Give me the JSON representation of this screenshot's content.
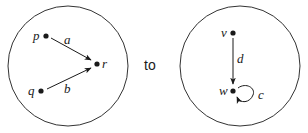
{
  "connector_text": "to",
  "left_graph": {
    "nodes": [
      {
        "id": "p",
        "label": "p"
      },
      {
        "id": "q",
        "label": "q"
      },
      {
        "id": "r",
        "label": "r"
      }
    ],
    "edges": [
      {
        "label": "a",
        "from": "p",
        "to": "r"
      },
      {
        "label": "b",
        "from": "q",
        "to": "r"
      }
    ]
  },
  "right_graph": {
    "nodes": [
      {
        "id": "v",
        "label": "v"
      },
      {
        "id": "w",
        "label": "w"
      }
    ],
    "edges": [
      {
        "label": "d",
        "from": "v",
        "to": "w"
      },
      {
        "label": "c",
        "from": "w",
        "to": "w",
        "type": "loop"
      }
    ]
  }
}
